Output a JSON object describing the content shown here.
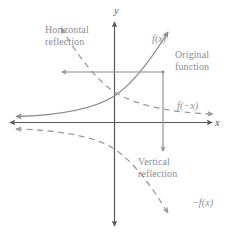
{
  "figure": {
    "background_color": "#ffffff",
    "curve_color": "#8a8a90",
    "axis_color": "#58585c",
    "label_color": "#8d8d93",
    "axes": {
      "x_label": "x",
      "y_label": "y"
    },
    "labels": {
      "horizontal_reflection": "Horizontal reflection",
      "original_function": "Original function",
      "vertical_reflection": "Vertical reflection",
      "f_of_x": "f(x)",
      "f_of_minus_x": "f(−x)",
      "minus_f_of_x": "−f(x)"
    },
    "curves": [
      {
        "name": "original-function",
        "label": "f(x)",
        "style": "solid",
        "description": "increasing exponential through the origin region rising to the upper right"
      },
      {
        "name": "horizontal-reflection",
        "label": "f(−x)",
        "style": "dashed",
        "description": "mirror of f(x) across the y-axis, decreasing from upper left to lower right"
      },
      {
        "name": "vertical-reflection",
        "label": "−f(x)",
        "style": "dashed",
        "description": "mirror of f(x) across the x-axis, decreasing from left toward lower right"
      }
    ]
  }
}
